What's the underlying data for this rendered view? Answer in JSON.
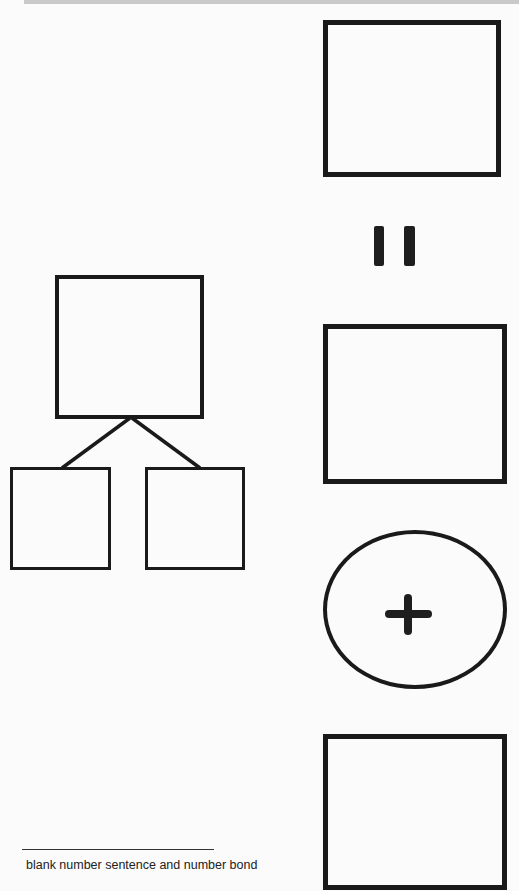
{
  "document": {
    "caption": "blank number sentence and number bond",
    "colors": {
      "background": "#fbfbfb",
      "stroke": "#1a1a1a",
      "top_bar": "#c9c9c9"
    }
  },
  "number_sentence": {
    "orientation": "vertical",
    "elements": [
      {
        "type": "blank-box",
        "name": "answer-box"
      },
      {
        "type": "operator",
        "symbol": "=",
        "name": "equals-sign"
      },
      {
        "type": "blank-box",
        "name": "addend-box-1"
      },
      {
        "type": "operator",
        "symbol": "+",
        "name": "plus-sign",
        "enclosed_in": "oval"
      },
      {
        "type": "blank-box",
        "name": "addend-box-2"
      }
    ]
  },
  "number_bond": {
    "whole": {
      "type": "blank-box",
      "name": "whole-box"
    },
    "parts": [
      {
        "type": "blank-box",
        "name": "part-box-left"
      },
      {
        "type": "blank-box",
        "name": "part-box-right"
      }
    ]
  }
}
